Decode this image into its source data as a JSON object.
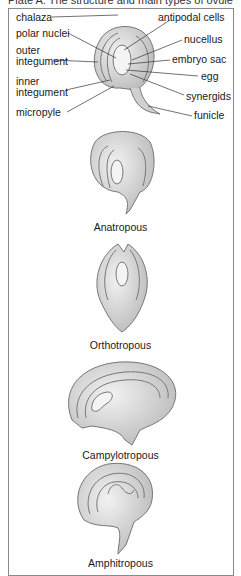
{
  "title": "Plate A: The structure and main types of ovule",
  "structure_labels": {
    "chalaza": "chalaza",
    "polar_nuclei": "polar nuclei",
    "outer_integument_1": "outer",
    "outer_integument_2": "integument",
    "inner_integument_1": "inner",
    "inner_integument_2": "integument",
    "micropyle": "micropyle",
    "antipodal_cells": "antipodal cells",
    "nucellus": "nucellus",
    "embryo_sac": "embryo sac",
    "egg": "egg",
    "synergids": "synergids",
    "funicle": "funicle"
  },
  "ovule_types": [
    {
      "name": "Anatropous"
    },
    {
      "name": "Orthotropous"
    },
    {
      "name": "Campylotropous"
    },
    {
      "name": "Amphitropous"
    }
  ],
  "colors": {
    "frame": "#8a8a8a",
    "tissue": "#d8d8d8",
    "shadow": "#9a9a9a",
    "text": "#1a1a1a"
  }
}
